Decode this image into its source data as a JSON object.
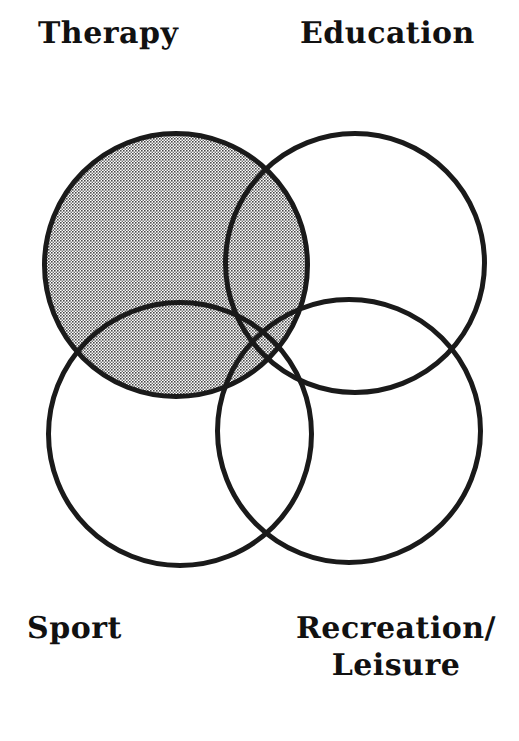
{
  "diagram": {
    "type": "venn",
    "title": "",
    "background_color": "#ffffff",
    "stroke_color": "#1a1a1a",
    "stroke_width": 5,
    "shaded_fill_color": "#a8a8a8",
    "shaded_fill_style": "halftone-dot-pattern",
    "unshaded_fill_color": "#ffffff",
    "circles": [
      {
        "key": "therapy",
        "label": "Therapy",
        "cx": 176,
        "cy": 265,
        "r": 134,
        "shaded": true,
        "label_position": "top-left"
      },
      {
        "key": "education",
        "label": "Education",
        "cx": 355,
        "cy": 263,
        "r": 132,
        "shaded": false,
        "label_position": "top-right"
      },
      {
        "key": "sport",
        "label": "Sport",
        "cx": 180,
        "cy": 434,
        "r": 134,
        "shaded": false,
        "label_position": "bottom-left"
      },
      {
        "key": "recreation",
        "label": "Recreation/\nLeisure",
        "label_line1": "Recreation/",
        "label_line2": "Leisure",
        "cx": 349,
        "cy": 431,
        "r": 134,
        "shaded": false,
        "label_position": "bottom-right"
      }
    ]
  },
  "labels": {
    "therapy": "Therapy",
    "education": "Education",
    "sport": "Sport",
    "recreation_line1": "Recreation/",
    "recreation_line2": "Leisure"
  }
}
